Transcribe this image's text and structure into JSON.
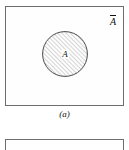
{
  "figure": {
    "type": "venn-diagram",
    "colors": {
      "page_background": "#ffffff",
      "box_fill": "#fefefe",
      "box_border": "#6e6e6e",
      "hatch_stroke": "#8a8a8a",
      "circle_border": "#4a4a4a",
      "text": "#111111"
    },
    "panel_a": {
      "name": "panel-a",
      "universal_set_box": {
        "label": "A",
        "label_notation": "A-complement-overbar",
        "position": "top-right"
      },
      "set_circle": {
        "label": "A",
        "fill_pattern": "diagonal-hatch",
        "hatch_angle_degrees": 45,
        "hatch_spacing_px": 3
      },
      "caption": "(a)"
    },
    "panel_b": {
      "name": "panel-b",
      "caption": "",
      "note": "second figure panel, cropped at bottom edge"
    }
  }
}
